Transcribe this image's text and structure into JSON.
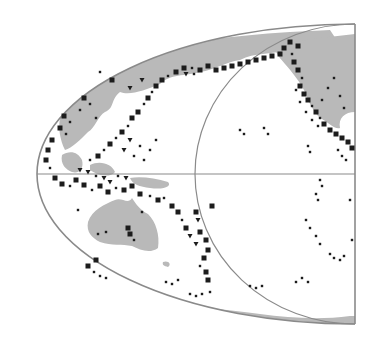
{
  "map": {
    "type": "seismicity-map",
    "region": "Pacific Ocean basin",
    "projection": "oblique half-ellipse",
    "colors": {
      "background": "#ffffff",
      "land": "#b9b9b9",
      "outline": "#8a8a8a",
      "events": "#1c1c1c"
    },
    "frame": {
      "ellipse": {
        "cx": 355,
        "cy": 174,
        "rx": 318,
        "ry": 150
      },
      "right_edge_x": 355,
      "equator_y": 174,
      "meridian_circle": {
        "cx": 355,
        "cy": 174,
        "rx": 160,
        "ry": 150
      }
    },
    "landmasses": [
      {
        "name": "Asia",
        "path": "M60,118 C70,90 100,70 140,55 C180,42 230,36 290,32 L330,30 L340,45 C320,48 300,52 288,50 C270,55 255,52 240,60 C225,62 215,70 200,72 C185,76 170,74 160,84 C145,90 130,96 120,92 C110,100 115,108 105,112 C98,116 95,128 88,132 C80,140 72,148 65,150 C60,140 58,128 60,118 Z"
      },
      {
        "name": "Southeast Asia",
        "path": "M62,155 C70,150 78,152 82,160 C84,168 80,174 72,172 C66,170 60,164 62,155 Z M90,165 C100,160 112,164 115,172 C110,178 98,176 90,170 Z"
      },
      {
        "name": "New Guinea",
        "path": "M130,178 C140,176 155,178 168,182 C172,186 165,190 150,188 C140,187 132,184 130,178 Z"
      },
      {
        "name": "Australia",
        "path": "M88,222 C92,210 105,204 115,200 C122,197 128,205 132,198 C136,204 140,210 148,214 C156,222 160,235 158,248 C150,254 140,250 132,246 C122,244 112,246 100,242 C92,238 86,232 88,222 Z"
      },
      {
        "name": "Tasmania-NZ",
        "path": "M163,262 C168,260 172,264 168,267 C164,266 162,265 163,262 Z"
      },
      {
        "name": "North America",
        "path": "M275,48 C290,42 305,40 320,38 L355,34 L355,112 C345,112 338,118 340,128 C335,130 328,122 320,118 C312,110 308,100 305,92 C300,82 292,72 285,64 C280,58 276,54 275,48 Z"
      },
      {
        "name": "Antarctica",
        "path": "M40,300 C70,300 110,304 150,304 C190,306 230,310 260,314 C290,318 320,320 350,316 L355,316 L355,324 C300,326 230,326 170,322 C120,318 70,310 40,300 Z"
      }
    ],
    "legend": {
      "large_square": "large shallow event",
      "small_square": "small shallow event",
      "triangle": "intermediate/deep event",
      "dot": "minor event"
    },
    "events": [
      {
        "x": 64,
        "y": 116,
        "s": "L"
      },
      {
        "x": 70,
        "y": 122,
        "s": "S"
      },
      {
        "x": 60,
        "y": 128,
        "s": "L"
      },
      {
        "x": 66,
        "y": 134,
        "s": "S"
      },
      {
        "x": 52,
        "y": 140,
        "s": "L"
      },
      {
        "x": 48,
        "y": 150,
        "s": "L"
      },
      {
        "x": 46,
        "y": 160,
        "s": "L"
      },
      {
        "x": 50,
        "y": 168,
        "s": "S"
      },
      {
        "x": 55,
        "y": 178,
        "s": "L"
      },
      {
        "x": 62,
        "y": 184,
        "s": "L"
      },
      {
        "x": 70,
        "y": 186,
        "s": "S"
      },
      {
        "x": 76,
        "y": 180,
        "s": "L"
      },
      {
        "x": 84,
        "y": 185,
        "s": "L"
      },
      {
        "x": 92,
        "y": 190,
        "s": "S"
      },
      {
        "x": 100,
        "y": 186,
        "s": "L"
      },
      {
        "x": 108,
        "y": 192,
        "s": "L"
      },
      {
        "x": 116,
        "y": 188,
        "s": "S"
      },
      {
        "x": 124,
        "y": 190,
        "s": "L"
      },
      {
        "x": 132,
        "y": 186,
        "s": "L"
      },
      {
        "x": 140,
        "y": 194,
        "s": "L"
      },
      {
        "x": 150,
        "y": 196,
        "s": "S"
      },
      {
        "x": 158,
        "y": 200,
        "s": "L"
      },
      {
        "x": 164,
        "y": 198,
        "s": "S"
      },
      {
        "x": 172,
        "y": 206,
        "s": "L"
      },
      {
        "x": 178,
        "y": 212,
        "s": "L"
      },
      {
        "x": 182,
        "y": 220,
        "s": "S"
      },
      {
        "x": 186,
        "y": 228,
        "s": "L"
      },
      {
        "x": 190,
        "y": 236,
        "s": "T"
      },
      {
        "x": 196,
        "y": 244,
        "s": "T"
      },
      {
        "x": 200,
        "y": 232,
        "s": "L"
      },
      {
        "x": 206,
        "y": 240,
        "s": "L"
      },
      {
        "x": 208,
        "y": 250,
        "s": "L"
      },
      {
        "x": 204,
        "y": 258,
        "s": "L"
      },
      {
        "x": 200,
        "y": 266,
        "s": "S"
      },
      {
        "x": 206,
        "y": 272,
        "s": "L"
      },
      {
        "x": 208,
        "y": 280,
        "s": "L"
      },
      {
        "x": 212,
        "y": 206,
        "s": "L"
      },
      {
        "x": 196,
        "y": 212,
        "s": "L"
      },
      {
        "x": 198,
        "y": 220,
        "s": "T"
      },
      {
        "x": 80,
        "y": 170,
        "s": "T"
      },
      {
        "x": 88,
        "y": 172,
        "s": "T"
      },
      {
        "x": 96,
        "y": 176,
        "s": "S"
      },
      {
        "x": 104,
        "y": 178,
        "s": "T"
      },
      {
        "x": 110,
        "y": 182,
        "s": "T"
      },
      {
        "x": 118,
        "y": 176,
        "s": "S"
      },
      {
        "x": 126,
        "y": 178,
        "s": "T"
      },
      {
        "x": 90,
        "y": 160,
        "s": "S"
      },
      {
        "x": 98,
        "y": 156,
        "s": "L"
      },
      {
        "x": 104,
        "y": 150,
        "s": "S"
      },
      {
        "x": 110,
        "y": 144,
        "s": "L"
      },
      {
        "x": 116,
        "y": 138,
        "s": "S"
      },
      {
        "x": 122,
        "y": 132,
        "s": "L"
      },
      {
        "x": 128,
        "y": 126,
        "s": "S"
      },
      {
        "x": 132,
        "y": 118,
        "s": "L"
      },
      {
        "x": 138,
        "y": 112,
        "s": "L"
      },
      {
        "x": 144,
        "y": 104,
        "s": "S"
      },
      {
        "x": 148,
        "y": 98,
        "s": "L"
      },
      {
        "x": 152,
        "y": 92,
        "s": "S"
      },
      {
        "x": 156,
        "y": 86,
        "s": "L"
      },
      {
        "x": 162,
        "y": 80,
        "s": "L"
      },
      {
        "x": 168,
        "y": 76,
        "s": "S"
      },
      {
        "x": 124,
        "y": 150,
        "s": "T"
      },
      {
        "x": 130,
        "y": 140,
        "s": "T"
      },
      {
        "x": 134,
        "y": 156,
        "s": "S"
      },
      {
        "x": 140,
        "y": 146,
        "s": "S"
      },
      {
        "x": 144,
        "y": 160,
        "s": "S"
      },
      {
        "x": 150,
        "y": 150,
        "s": "S"
      },
      {
        "x": 156,
        "y": 140,
        "s": "S"
      },
      {
        "x": 130,
        "y": 88,
        "s": "T"
      },
      {
        "x": 142,
        "y": 80,
        "s": "T"
      },
      {
        "x": 112,
        "y": 80,
        "s": "L"
      },
      {
        "x": 100,
        "y": 72,
        "s": "S"
      },
      {
        "x": 84,
        "y": 98,
        "s": "L"
      },
      {
        "x": 90,
        "y": 104,
        "s": "S"
      },
      {
        "x": 80,
        "y": 110,
        "s": "S"
      },
      {
        "x": 96,
        "y": 118,
        "s": "S"
      },
      {
        "x": 176,
        "y": 72,
        "s": "L"
      },
      {
        "x": 184,
        "y": 68,
        "s": "L"
      },
      {
        "x": 192,
        "y": 68,
        "s": "S"
      },
      {
        "x": 200,
        "y": 70,
        "s": "L"
      },
      {
        "x": 208,
        "y": 66,
        "s": "L"
      },
      {
        "x": 216,
        "y": 70,
        "s": "L"
      },
      {
        "x": 224,
        "y": 68,
        "s": "L"
      },
      {
        "x": 232,
        "y": 66,
        "s": "L"
      },
      {
        "x": 240,
        "y": 64,
        "s": "L"
      },
      {
        "x": 248,
        "y": 62,
        "s": "L"
      },
      {
        "x": 256,
        "y": 60,
        "s": "L"
      },
      {
        "x": 264,
        "y": 58,
        "s": "L"
      },
      {
        "x": 272,
        "y": 56,
        "s": "L"
      },
      {
        "x": 280,
        "y": 54,
        "s": "L"
      },
      {
        "x": 284,
        "y": 48,
        "s": "L"
      },
      {
        "x": 290,
        "y": 42,
        "s": "L"
      },
      {
        "x": 298,
        "y": 46,
        "s": "L"
      },
      {
        "x": 292,
        "y": 54,
        "s": "S"
      },
      {
        "x": 186,
        "y": 74,
        "s": "T"
      },
      {
        "x": 194,
        "y": 74,
        "s": "S"
      },
      {
        "x": 294,
        "y": 62,
        "s": "L"
      },
      {
        "x": 298,
        "y": 70,
        "s": "L"
      },
      {
        "x": 302,
        "y": 78,
        "s": "S"
      },
      {
        "x": 300,
        "y": 86,
        "s": "L"
      },
      {
        "x": 304,
        "y": 94,
        "s": "L"
      },
      {
        "x": 308,
        "y": 100,
        "s": "L"
      },
      {
        "x": 312,
        "y": 106,
        "s": "S"
      },
      {
        "x": 316,
        "y": 112,
        "s": "L"
      },
      {
        "x": 320,
        "y": 118,
        "s": "S"
      },
      {
        "x": 324,
        "y": 124,
        "s": "L"
      },
      {
        "x": 330,
        "y": 130,
        "s": "L"
      },
      {
        "x": 336,
        "y": 134,
        "s": "L"
      },
      {
        "x": 342,
        "y": 138,
        "s": "L"
      },
      {
        "x": 348,
        "y": 142,
        "s": "L"
      },
      {
        "x": 352,
        "y": 148,
        "s": "L"
      },
      {
        "x": 296,
        "y": 90,
        "s": "S"
      },
      {
        "x": 300,
        "y": 102,
        "s": "S"
      },
      {
        "x": 306,
        "y": 112,
        "s": "S"
      },
      {
        "x": 312,
        "y": 120,
        "s": "S"
      },
      {
        "x": 318,
        "y": 126,
        "s": "S"
      },
      {
        "x": 322,
        "y": 100,
        "s": "S"
      },
      {
        "x": 328,
        "y": 88,
        "s": "S"
      },
      {
        "x": 334,
        "y": 78,
        "s": "S"
      },
      {
        "x": 340,
        "y": 96,
        "s": "S"
      },
      {
        "x": 344,
        "y": 108,
        "s": "S"
      },
      {
        "x": 338,
        "y": 150,
        "s": "S"
      },
      {
        "x": 342,
        "y": 156,
        "s": "S"
      },
      {
        "x": 346,
        "y": 160,
        "s": "S"
      },
      {
        "x": 264,
        "y": 128,
        "s": "S"
      },
      {
        "x": 268,
        "y": 134,
        "s": "S"
      },
      {
        "x": 240,
        "y": 130,
        "s": "S"
      },
      {
        "x": 244,
        "y": 134,
        "s": "S"
      },
      {
        "x": 308,
        "y": 146,
        "s": "S"
      },
      {
        "x": 310,
        "y": 152,
        "s": "S"
      },
      {
        "x": 320,
        "y": 180,
        "s": "S"
      },
      {
        "x": 322,
        "y": 186,
        "s": "S"
      },
      {
        "x": 316,
        "y": 194,
        "s": "S"
      },
      {
        "x": 318,
        "y": 200,
        "s": "S"
      },
      {
        "x": 306,
        "y": 220,
        "s": "S"
      },
      {
        "x": 310,
        "y": 228,
        "s": "S"
      },
      {
        "x": 316,
        "y": 236,
        "s": "S"
      },
      {
        "x": 320,
        "y": 244,
        "s": "S"
      },
      {
        "x": 330,
        "y": 254,
        "s": "S"
      },
      {
        "x": 334,
        "y": 258,
        "s": "S"
      },
      {
        "x": 340,
        "y": 260,
        "s": "S"
      },
      {
        "x": 344,
        "y": 256,
        "s": "S"
      },
      {
        "x": 350,
        "y": 200,
        "s": "S"
      },
      {
        "x": 352,
        "y": 240,
        "s": "S"
      },
      {
        "x": 296,
        "y": 282,
        "s": "S"
      },
      {
        "x": 302,
        "y": 278,
        "s": "S"
      },
      {
        "x": 308,
        "y": 282,
        "s": "S"
      },
      {
        "x": 250,
        "y": 286,
        "s": "S"
      },
      {
        "x": 256,
        "y": 288,
        "s": "S"
      },
      {
        "x": 262,
        "y": 286,
        "s": "S"
      },
      {
        "x": 166,
        "y": 282,
        "s": "S"
      },
      {
        "x": 172,
        "y": 284,
        "s": "S"
      },
      {
        "x": 178,
        "y": 280,
        "s": "S"
      },
      {
        "x": 190,
        "y": 294,
        "s": "S"
      },
      {
        "x": 196,
        "y": 296,
        "s": "S"
      },
      {
        "x": 202,
        "y": 294,
        "s": "S"
      },
      {
        "x": 210,
        "y": 292,
        "s": "S"
      },
      {
        "x": 128,
        "y": 228,
        "s": "L"
      },
      {
        "x": 130,
        "y": 234,
        "s": "L"
      },
      {
        "x": 98,
        "y": 234,
        "s": "S"
      },
      {
        "x": 106,
        "y": 232,
        "s": "S"
      },
      {
        "x": 134,
        "y": 240,
        "s": "S"
      },
      {
        "x": 96,
        "y": 260,
        "s": "L"
      },
      {
        "x": 88,
        "y": 266,
        "s": "L"
      },
      {
        "x": 94,
        "y": 272,
        "s": "S"
      },
      {
        "x": 100,
        "y": 276,
        "s": "S"
      },
      {
        "x": 106,
        "y": 278,
        "s": "S"
      },
      {
        "x": 78,
        "y": 210,
        "s": "S"
      },
      {
        "x": 142,
        "y": 212,
        "s": "S"
      }
    ]
  }
}
